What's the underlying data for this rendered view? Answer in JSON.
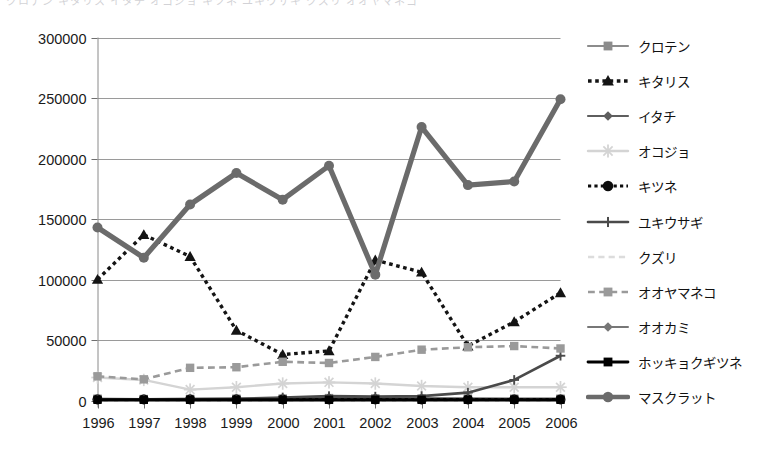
{
  "topcrop": {
    "text": "クロテン キタリス イタチ オコジョ キツネ ユキウサギ クズリ オオヤマネコ"
  },
  "chart_data": {
    "type": "line",
    "title": "",
    "xlabel": "",
    "ylabel": "",
    "x": [
      "1996",
      "1997",
      "1998",
      "1999",
      "2000",
      "2001",
      "2002",
      "2003",
      "2004",
      "2005",
      "2006"
    ],
    "ylim": [
      0,
      300000
    ],
    "ytick_values": [
      0,
      50000,
      100000,
      150000,
      200000,
      250000,
      300000
    ],
    "ytick_labels": [
      "0",
      "50000",
      "100000",
      "150000",
      "200000",
      "250000",
      "300000"
    ],
    "grid": true,
    "legend_position": "right",
    "series": [
      {
        "name": "クロテン",
        "color": "#8c8c8c",
        "marker": "square",
        "dash": "solid",
        "width": 2.2,
        "values": [
          1500,
          1200,
          1300,
          1500,
          1600,
          2000,
          1800,
          1700,
          1600,
          1500,
          1500
        ]
      },
      {
        "name": "キタリス",
        "color": "#141414",
        "marker": "triangle",
        "dash": "dotted",
        "width": 3.4,
        "values": [
          100000,
          137000,
          119000,
          58000,
          38000,
          41000,
          116000,
          106000,
          45000,
          65000,
          89000
        ]
      },
      {
        "name": "イタチ",
        "color": "#5e5e5e",
        "marker": "diamond",
        "dash": "solid",
        "width": 2.2,
        "values": [
          700,
          900,
          1000,
          900,
          1100,
          2200,
          2000,
          1800,
          1500,
          1400,
          1300
        ]
      },
      {
        "name": "オコジョ",
        "color": "#d4d4d4",
        "marker": "star",
        "dash": "solid",
        "width": 2.4,
        "values": [
          19000,
          17000,
          9000,
          11000,
          14000,
          15000,
          14000,
          12000,
          11000,
          11000,
          11000
        ]
      },
      {
        "name": "キツネ",
        "color": "#0d0d0d",
        "marker": "circle",
        "dash": "dotted",
        "width": 3.0,
        "values": [
          900,
          900,
          900,
          900,
          900,
          900,
          900,
          900,
          900,
          900,
          900
        ]
      },
      {
        "name": "ユキウサギ",
        "color": "#4a4a4a",
        "marker": "plus",
        "dash": "solid",
        "width": 2.6,
        "values": [
          900,
          1000,
          1200,
          1500,
          2500,
          3600,
          3200,
          3600,
          6500,
          17000,
          37000
        ]
      },
      {
        "name": "クズリ",
        "color": "#dcdcdc",
        "marker": "none",
        "dash": "dashed",
        "width": 2.4,
        "values": [
          300,
          300,
          300,
          300,
          300,
          300,
          300,
          300,
          300,
          300,
          300
        ]
      },
      {
        "name": "オオヤマネコ",
        "color": "#9a9a9a",
        "marker": "square",
        "dash": "dashed",
        "width": 2.6,
        "values": [
          20000,
          17500,
          27000,
          27500,
          32000,
          31000,
          36000,
          42000,
          44000,
          45000,
          43000
        ]
      },
      {
        "name": "オオカミ",
        "color": "#777777",
        "marker": "diamond",
        "dash": "solid",
        "width": 2.0,
        "values": [
          400,
          400,
          400,
          400,
          400,
          400,
          400,
          400,
          400,
          400,
          400
        ]
      },
      {
        "name": "ホッキョクギツネ",
        "color": "#000000",
        "marker": "square",
        "dash": "solid",
        "width": 2.8,
        "values": [
          600,
          600,
          600,
          600,
          600,
          600,
          600,
          600,
          600,
          600,
          600
        ]
      },
      {
        "name": "マスクラット",
        "color": "#6b6b6b",
        "marker": "circle",
        "dash": "solid",
        "width": 5.2,
        "values": [
          143000,
          118000,
          162000,
          188000,
          166000,
          194000,
          104000,
          226000,
          178000,
          181000,
          249000
        ]
      }
    ]
  }
}
